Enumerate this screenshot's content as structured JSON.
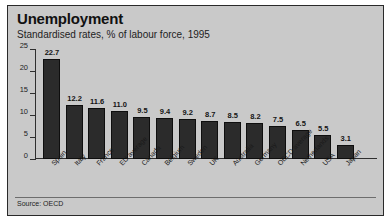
{
  "figure": {
    "title": "Unemployment",
    "subtitle": "Standardised rates, % of labour force, 1995",
    "source": "Source: OECD",
    "frame_color": "#c9c9c9",
    "bar_color": "#2b2b2b",
    "axis_color": "#2f2f2f"
  },
  "chart_data": {
    "type": "bar",
    "title": "Unemployment",
    "subtitle": "Standardised rates, % of labour force, 1995",
    "xlabel": "",
    "ylabel": "",
    "ylim": [
      0,
      25
    ],
    "yticks": [
      0,
      5,
      10,
      15,
      20,
      25
    ],
    "grid": false,
    "legend": "none",
    "annotation": "Source: OECD",
    "categories": [
      "Spain",
      "Italy",
      "France",
      "EU average",
      "Canada",
      "Belgium",
      "Sweden",
      "UK",
      "Australia",
      "Germany",
      "OECD average",
      "Netherlands",
      "USA",
      "Japan"
    ],
    "values": [
      22.7,
      12.2,
      11.6,
      11.0,
      9.5,
      9.4,
      9.2,
      8.7,
      8.5,
      8.2,
      7.5,
      6.5,
      5.5,
      3.1
    ],
    "value_labels": [
      "22.7",
      "12.2",
      "11.6",
      "11.0",
      "9.5",
      "9.4",
      "9.2",
      "8.7",
      "8.5",
      "8.2",
      "7.5",
      "6.5",
      "5.5",
      "3.1"
    ]
  }
}
